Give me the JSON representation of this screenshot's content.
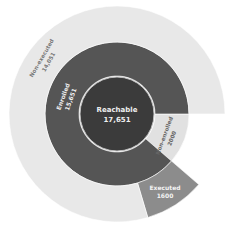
{
  "chart_data": {
    "type": "sunburst",
    "title": "",
    "center": {
      "label": "Reachable",
      "value": 17651,
      "value_text": "17,651",
      "color": "#3b3b3b"
    },
    "rings": [
      {
        "level": 1,
        "segments": [
          {
            "label": "Enrolled",
            "value": 15651,
            "value_text": "15,651",
            "color": "#555555"
          },
          {
            "label": "Non-enrolled",
            "value": 2000,
            "value_text": "2000",
            "color": "#e1e1e1"
          }
        ]
      },
      {
        "level": 2,
        "parent": "Enrolled",
        "segments": [
          {
            "label": "Executed",
            "value": 1600,
            "value_text": "1600",
            "color": "#8c8c8c"
          },
          {
            "label": "Non-executed",
            "value": 14051,
            "value_text": "14,051",
            "color": "#e8e8e8"
          }
        ]
      }
    ]
  }
}
